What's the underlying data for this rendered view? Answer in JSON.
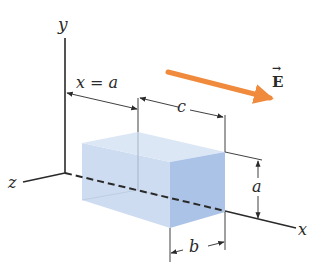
{
  "figure": {
    "type": "3D rectangular box in uniform electric field",
    "axes": {
      "y_label": "y",
      "z_label": "z",
      "x_label": "x"
    },
    "field": {
      "label": "E",
      "vector_arrow": "→",
      "arrow_color": "#f08a3c"
    },
    "dimensions": {
      "position_label": "x = a",
      "length_label": "c",
      "height_label": "a",
      "depth_label": "b"
    },
    "colors": {
      "box_light": "#c9daf0",
      "box_top": "#dbe6f5",
      "box_front": "#a9c2e6",
      "line": "#2a2a2a"
    }
  }
}
